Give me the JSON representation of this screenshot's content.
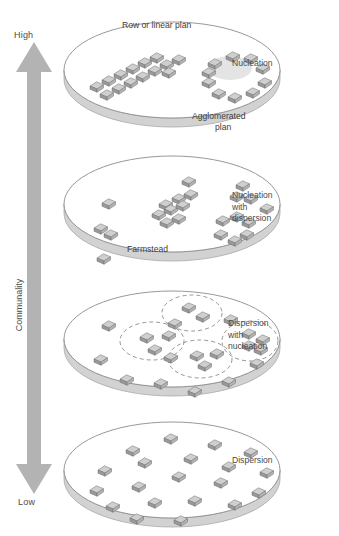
{
  "figure": {
    "axis": {
      "label": "Communality",
      "high_label": "High",
      "low_label": "Low",
      "arrow_color": "#b0b0b0",
      "direction": "bidirectional-vertical"
    },
    "colors": {
      "disk_fill": "#ffffff",
      "disk_edge": "#8c8c8c",
      "disk_rim": "#a8a8a8",
      "building_top": "#cfcfcf",
      "building_side": "#9a9a9a",
      "building_outline": "#6e6e6e",
      "green_fill": "#e4e4e4",
      "dashed_stroke": "#8a8a8a",
      "text": "#4a4a4a"
    }
  },
  "panels": [
    {
      "id": "nucleation",
      "caption": "Nucleation",
      "inner_labels": [
        {
          "text": "Row or linear plan",
          "x": 58,
          "y": 6
        },
        {
          "text": "Agglomerated",
          "x": 128,
          "y": 97
        },
        {
          "text": "plan",
          "x": 151,
          "y": 108
        }
      ],
      "has_green": true,
      "buildings": [
        {
          "x": 26,
          "y": 72
        },
        {
          "x": 38,
          "y": 66
        },
        {
          "x": 50,
          "y": 60
        },
        {
          "x": 62,
          "y": 54
        },
        {
          "x": 74,
          "y": 48
        },
        {
          "x": 86,
          "y": 43
        },
        {
          "x": 36,
          "y": 80
        },
        {
          "x": 48,
          "y": 74
        },
        {
          "x": 60,
          "y": 68
        },
        {
          "x": 72,
          "y": 62
        },
        {
          "x": 84,
          "y": 56
        },
        {
          "x": 96,
          "y": 50
        },
        {
          "x": 108,
          "y": 45
        },
        {
          "x": 98,
          "y": 58
        },
        {
          "x": 144,
          "y": 49
        },
        {
          "x": 162,
          "y": 42
        },
        {
          "x": 180,
          "y": 44
        },
        {
          "x": 192,
          "y": 54
        },
        {
          "x": 194,
          "y": 68
        },
        {
          "x": 182,
          "y": 78
        },
        {
          "x": 164,
          "y": 83
        },
        {
          "x": 148,
          "y": 79
        },
        {
          "x": 138,
          "y": 68
        },
        {
          "x": 138,
          "y": 58
        }
      ],
      "green": {
        "cx": 166,
        "cy": 62,
        "rx": 22,
        "ry": 12
      },
      "clusters": []
    },
    {
      "id": "nucleation-with-dispersion",
      "caption": "Nucleation\nwith\ndispersion",
      "inner_labels": [
        {
          "text": "Farmstead",
          "x": 63,
          "y": 96
        }
      ],
      "has_green": false,
      "buildings": [
        {
          "x": 38,
          "y": 55
        },
        {
          "x": 30,
          "y": 80
        },
        {
          "x": 40,
          "y": 86
        },
        {
          "x": 33,
          "y": 110
        },
        {
          "x": 95,
          "y": 56
        },
        {
          "x": 108,
          "y": 50
        },
        {
          "x": 120,
          "y": 46
        },
        {
          "x": 88,
          "y": 66
        },
        {
          "x": 100,
          "y": 61
        },
        {
          "x": 112,
          "y": 57
        },
        {
          "x": 96,
          "y": 74
        },
        {
          "x": 108,
          "y": 70
        },
        {
          "x": 118,
          "y": 33
        },
        {
          "x": 172,
          "y": 37
        },
        {
          "x": 166,
          "y": 48
        },
        {
          "x": 180,
          "y": 50
        },
        {
          "x": 152,
          "y": 72
        },
        {
          "x": 166,
          "y": 68
        },
        {
          "x": 178,
          "y": 74
        },
        {
          "x": 150,
          "y": 86
        },
        {
          "x": 164,
          "y": 92
        },
        {
          "x": 176,
          "y": 86
        },
        {
          "x": 196,
          "y": 60
        }
      ],
      "clusters": []
    },
    {
      "id": "dispersion-with-nucleation",
      "caption": "Dispersion\nwith\nnucleation",
      "inner_labels": [],
      "has_green": false,
      "buildings": [
        {
          "x": 118,
          "y": 24
        },
        {
          "x": 132,
          "y": 33
        },
        {
          "x": 76,
          "y": 54
        },
        {
          "x": 98,
          "y": 52
        },
        {
          "x": 84,
          "y": 66
        },
        {
          "x": 126,
          "y": 72
        },
        {
          "x": 146,
          "y": 70
        },
        {
          "x": 134,
          "y": 82
        },
        {
          "x": 178,
          "y": 50
        },
        {
          "x": 192,
          "y": 56
        },
        {
          "x": 178,
          "y": 62
        },
        {
          "x": 190,
          "y": 66
        },
        {
          "x": 38,
          "y": 42
        },
        {
          "x": 30,
          "y": 76
        },
        {
          "x": 56,
          "y": 96
        },
        {
          "x": 90,
          "y": 100
        },
        {
          "x": 124,
          "y": 108
        },
        {
          "x": 158,
          "y": 98
        },
        {
          "x": 186,
          "y": 80
        },
        {
          "x": 160,
          "y": 36
        },
        {
          "x": 104,
          "y": 40
        },
        {
          "x": 100,
          "y": 74
        }
      ],
      "clusters": [
        {
          "cx": 128,
          "cy": 30,
          "rx": 30,
          "ry": 18
        },
        {
          "cx": 88,
          "cy": 58,
          "rx": 32,
          "ry": 19
        },
        {
          "cx": 136,
          "cy": 76,
          "rx": 32,
          "ry": 19
        },
        {
          "cx": 186,
          "cy": 58,
          "rx": 28,
          "ry": 20
        }
      ]
    },
    {
      "id": "dispersion",
      "caption": "Dispersion",
      "inner_labels": [],
      "has_green": false,
      "buildings": [
        {
          "x": 62,
          "y": 36
        },
        {
          "x": 100,
          "y": 24
        },
        {
          "x": 144,
          "y": 30
        },
        {
          "x": 180,
          "y": 38
        },
        {
          "x": 34,
          "y": 56
        },
        {
          "x": 74,
          "y": 48
        },
        {
          "x": 120,
          "y": 44
        },
        {
          "x": 158,
          "y": 52
        },
        {
          "x": 196,
          "y": 58
        },
        {
          "x": 26,
          "y": 76
        },
        {
          "x": 68,
          "y": 72
        },
        {
          "x": 108,
          "y": 62
        },
        {
          "x": 150,
          "y": 68
        },
        {
          "x": 188,
          "y": 78
        },
        {
          "x": 42,
          "y": 92
        },
        {
          "x": 84,
          "y": 88
        },
        {
          "x": 124,
          "y": 86
        },
        {
          "x": 164,
          "y": 90
        },
        {
          "x": 66,
          "y": 104
        },
        {
          "x": 110,
          "y": 106
        }
      ]
    }
  ]
}
